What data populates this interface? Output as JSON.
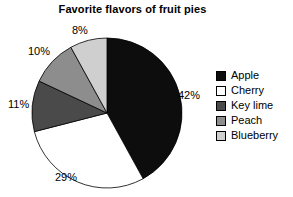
{
  "chart_data": {
    "type": "pie",
    "title": "Favorite flavors of fruit pies",
    "xlabel": "",
    "ylabel": "",
    "legend_position": "right",
    "grid": false,
    "start_angle_deg": 90,
    "direction": "clockwise",
    "categories": [
      "Apple",
      "Cherry",
      "Key lime",
      "Peach",
      "Blueberry"
    ],
    "values": [
      42,
      29,
      11,
      10,
      8
    ],
    "value_labels": [
      "42%",
      "29%",
      "11%",
      "10%",
      "8%"
    ],
    "colors": [
      "#0d0d0d",
      "#ffffff",
      "#4a4a4a",
      "#8d8d8d",
      "#cfcfcf"
    ],
    "slices": [
      {
        "label": "Apple",
        "value": 42,
        "value_label": "42%",
        "color": "#0d0d0d"
      },
      {
        "label": "Cherry",
        "value": 29,
        "value_label": "29%",
        "color": "#ffffff"
      },
      {
        "label": "Key lime",
        "value": 11,
        "value_label": "11%",
        "color": "#4a4a4a"
      },
      {
        "label": "Peach",
        "value": 10,
        "value_label": "10%",
        "color": "#8d8d8d"
      },
      {
        "label": "Blueberry",
        "value": 8,
        "value_label": "8%",
        "color": "#cfcfcf"
      }
    ]
  },
  "legend": {
    "items": [
      {
        "label": "Apple",
        "color": "#0d0d0d"
      },
      {
        "label": "Cherry",
        "color": "#ffffff"
      },
      {
        "label": "Key lime",
        "color": "#4a4a4a"
      },
      {
        "label": "Peach",
        "color": "#8d8d8d"
      },
      {
        "label": "Blueberry",
        "color": "#cfcfcf"
      }
    ]
  },
  "annotations": {
    "apple_pct": "42%",
    "cherry_pct": "29%",
    "keylime_pct": "11%",
    "peach_pct": "10%",
    "blueberry_pct": "8%"
  }
}
